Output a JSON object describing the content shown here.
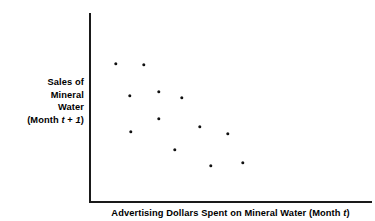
{
  "chart_data": {
    "type": "scatter",
    "title": "",
    "subtitle": "",
    "xlabel_parts": {
      "prefix": "Advertising Dollars Spent on Mineral Water (Month ",
      "italic": "t",
      "suffix": ")"
    },
    "xlabel": "Advertising Dollars Spent on Mineral Water (Month t)",
    "ylabel_lines": [
      "Sales of",
      "Mineral",
      "Water"
    ],
    "ylabel_last_line": {
      "prefix": "(Month ",
      "italic_1": "t",
      "middle": " + ",
      "italic_2": "1",
      "suffix": ")"
    },
    "ylabel": "Sales of Mineral Water (Month t + 1)",
    "grid": false,
    "legend": "none",
    "axis_ticks": [],
    "xlim": [
      0,
      100
    ],
    "ylim": [
      0,
      100
    ],
    "marker_color": "#111111",
    "axis_color": "#1a1a1a",
    "relationship": "negative",
    "n_points": 12,
    "points": [
      {
        "id": "p1",
        "px": 116,
        "py": 64,
        "x": 10.4,
        "y": 73.7
      },
      {
        "id": "p2",
        "px": 144,
        "py": 65,
        "x": 20.3,
        "y": 72.6
      },
      {
        "id": "p3",
        "px": 159,
        "py": 92,
        "x": 25.6,
        "y": 58.4
      },
      {
        "id": "p4",
        "px": 130,
        "py": 96,
        "x": 15.3,
        "y": 56.3
      },
      {
        "id": "p5",
        "px": 182,
        "py": 98,
        "x": 33.7,
        "y": 55.3
      },
      {
        "id": "p6",
        "px": 159,
        "py": 119,
        "x": 25.6,
        "y": 44.2
      },
      {
        "id": "p7",
        "px": 200,
        "py": 127,
        "x": 40.1,
        "y": 40.0
      },
      {
        "id": "p8",
        "px": 131,
        "py": 132,
        "x": 15.7,
        "y": 37.4
      },
      {
        "id": "p9",
        "px": 228,
        "py": 134,
        "x": 50.0,
        "y": 36.3
      },
      {
        "id": "p10",
        "px": 175,
        "py": 150,
        "x": 31.2,
        "y": 27.9
      },
      {
        "id": "p11",
        "px": 211,
        "py": 166,
        "x": 44.0,
        "y": 19.5
      },
      {
        "id": "p12",
        "px": 243,
        "py": 163,
        "x": 55.3,
        "y": 21.1
      }
    ]
  }
}
